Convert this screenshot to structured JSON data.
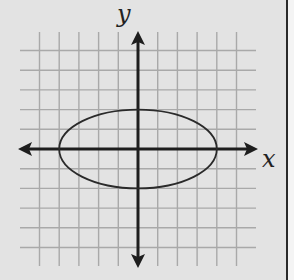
{
  "chart_data": {
    "type": "line",
    "title": "",
    "xlabel": "x",
    "ylabel": "y",
    "grid": true,
    "xlim": [
      -5.5,
      5.5
    ],
    "ylim": [
      -5.5,
      5.5
    ],
    "grid_x": [
      -5,
      -4,
      -3,
      -2,
      -1,
      0,
      1,
      2,
      3,
      4,
      5
    ],
    "grid_y": [
      -5,
      -4,
      -3,
      -2,
      -1,
      0,
      1,
      2,
      3,
      4,
      5
    ],
    "tick_labels_shown": false,
    "series": [
      {
        "name": "ellipse",
        "shape": "ellipse",
        "center": [
          0,
          0
        ],
        "semi_axis_x": 4,
        "semi_axis_y": 2,
        "equation": "x^2/16 + y^2/4 = 1",
        "points": [
          [
            -4,
            0
          ],
          [
            4,
            0
          ],
          [
            0,
            2
          ],
          [
            0,
            -2
          ]
        ]
      }
    ],
    "legend": null
  },
  "colors": {
    "background": "#e3e3e3",
    "grid": "#a9a9a9",
    "axis": "#1e1e1e",
    "curve": "#2a2a2a"
  }
}
